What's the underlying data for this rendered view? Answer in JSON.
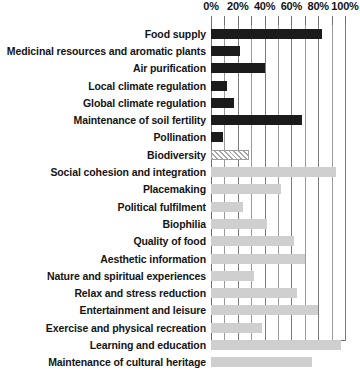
{
  "chart_data": {
    "type": "bar",
    "orientation": "horizontal",
    "title": "",
    "subtitle": "",
    "xlabel": "",
    "ylabel": "",
    "xlim": [
      0,
      100
    ],
    "grid": true,
    "grid_axis": "x",
    "legend": "none",
    "tick_labels": [
      "0%",
      "20%",
      "40%",
      "60%",
      "80%",
      "100%"
    ],
    "tick_values": [
      0,
      20,
      40,
      60,
      80,
      100
    ],
    "minor_tick_values": [
      10,
      30,
      50,
      70,
      90
    ],
    "categories": [
      "Food supply",
      "Medicinal resources and aromatic plants",
      "Air purification",
      "Local climate regulation",
      "Global climate regulation",
      "Maintenance of soil fertility",
      "Pollination",
      "Biodiversity",
      "Social cohesion and integration",
      "Placemaking",
      "Political fulfilment",
      "Biophilia",
      "Quality of food",
      "Aesthetic information",
      "Nature and spiritual experiences",
      "Relax and stress reduction",
      "Entertainment and leisure",
      "Exercise and physical recreation",
      "Learning and education",
      "Maintenance of cultural heritage"
    ],
    "values": [
      83,
      22,
      40,
      12,
      17,
      68,
      9,
      28,
      93,
      52,
      24,
      42,
      62,
      70,
      32,
      64,
      80,
      38,
      97,
      75
    ],
    "styles": [
      "dark",
      "dark",
      "dark",
      "dark",
      "dark",
      "dark",
      "dark",
      "hatch",
      "light",
      "light",
      "light",
      "light",
      "light",
      "light",
      "light",
      "light",
      "light",
      "light",
      "light",
      "light"
    ],
    "colors": {
      "dark": "#1b1b1b",
      "light": "#cfcfcf",
      "hatch": "#a8a8a8",
      "grid": "#9a9a9a",
      "axis": "#6f6f6f",
      "text": "#141414",
      "background": "#ffffff"
    }
  }
}
